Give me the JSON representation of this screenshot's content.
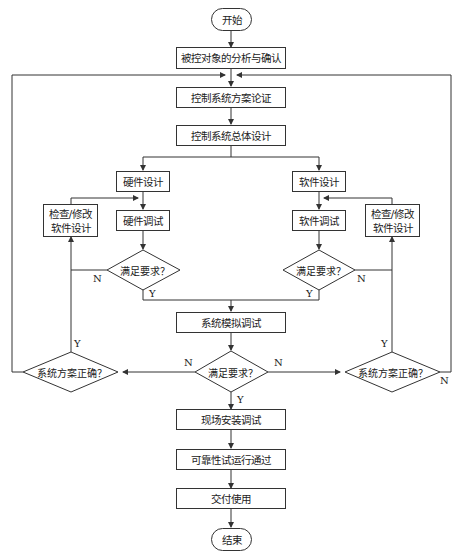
{
  "flowchart": {
    "start": "开始",
    "end": "结束",
    "steps": {
      "analysis": "被控对象的分析与确认",
      "scheme": "控制系统方案论证",
      "overall_design": "控制系统总体设计",
      "hw_design": "硬件设计",
      "sw_design": "软件设计",
      "hw_debug": "硬件调试",
      "sw_debug": "软件调试",
      "check_left": [
        "检查/修改",
        "软件设计"
      ],
      "check_right": [
        "检查/修改",
        "软件设计"
      ],
      "sim_debug": "系统模拟调试",
      "site_install": "现场安装调试",
      "reliability": "可靠性试运行通过",
      "delivery": "交付使用"
    },
    "decisions": {
      "hw_ok": "满足要求？",
      "sw_ok": "满足要求？",
      "sim_ok": "满足要求？",
      "scheme_ok_left": "系统方案正确？",
      "scheme_ok_right": "系统方案正确？"
    },
    "branch_labels": {
      "yes": "Y",
      "no": "N"
    }
  }
}
